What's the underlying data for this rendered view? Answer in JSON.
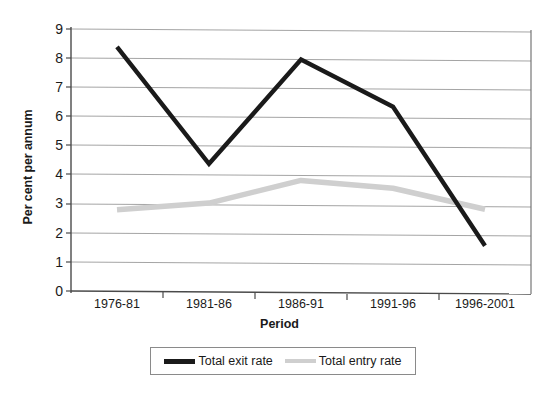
{
  "chart_data": {
    "type": "line",
    "title": "",
    "xlabel": "Period",
    "ylabel": "Per cent per annum",
    "categories": [
      "1976-81",
      "1981-86",
      "1986-91",
      "1991-96",
      "1996-2001"
    ],
    "series": [
      {
        "name": "Total exit rate",
        "color": "#1a1a1a",
        "values": [
          8.4,
          4.4,
          8.0,
          6.4,
          1.65
        ]
      },
      {
        "name": "Total entry rate",
        "color": "#cfcfcf",
        "values": [
          2.8,
          3.05,
          3.85,
          3.6,
          2.9
        ]
      }
    ],
    "ylim": [
      0,
      9
    ],
    "ytick_labels": [
      "0",
      "1",
      "2",
      "3",
      "4",
      "5",
      "6",
      "7",
      "8",
      "9"
    ],
    "grid": "horizontal",
    "legend_position": "bottom"
  },
  "legend": {
    "items": [
      {
        "label": "Total exit rate",
        "swatch_name": "legend-swatch-exit"
      },
      {
        "label": "Total entry rate",
        "swatch_name": "legend-swatch-entry"
      }
    ]
  },
  "colors": {
    "exit_line": "#1a1a1a",
    "entry_line": "#cfcfcf",
    "gridline": "#9a9a9a",
    "axis": "#555555",
    "background": "#ffffff"
  }
}
